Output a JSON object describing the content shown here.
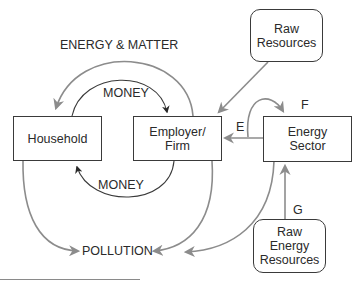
{
  "diagram": {
    "type": "flow-diagram",
    "colors": {
      "box_border": "#3a3a3a",
      "flow_arrow": "#8c8c8c",
      "money_arrow": "#2a2a2a",
      "text": "#2a2a2a"
    },
    "nodes": {
      "household": {
        "label": "Household"
      },
      "employer": {
        "line1": "Employer/",
        "line2": "Firm"
      },
      "energy_sector": {
        "line1": "Energy",
        "line2": "Sector"
      },
      "raw_resources": {
        "line1": "Raw",
        "line2": "Resources"
      },
      "raw_energy_resources": {
        "line1": "Raw",
        "line2": "Energy",
        "line3": "Resources"
      }
    },
    "labels": {
      "energy_matter": "ENERGY & MATTER",
      "money_top": "MONEY",
      "money_bottom": "MONEY",
      "pollution": "POLLUTION",
      "e": "E",
      "f": "F",
      "g": "G"
    },
    "edges": [
      {
        "from": "employer",
        "to": "household",
        "label": "ENERGY & MATTER"
      },
      {
        "from": "household",
        "to": "employer",
        "label": "MONEY"
      },
      {
        "from": "employer",
        "to": "household",
        "label": "MONEY"
      },
      {
        "from": "raw_resources",
        "to": "employer",
        "label": ""
      },
      {
        "from": "energy_sector",
        "to": "employer",
        "label": "E"
      },
      {
        "from": "energy_sector",
        "to": "energy_sector",
        "label": "F"
      },
      {
        "from": "raw_energy_resources",
        "to": "energy_sector",
        "label": "G"
      },
      {
        "from": "household",
        "to": "pollution",
        "label": ""
      },
      {
        "from": "employer",
        "to": "pollution",
        "label": ""
      },
      {
        "from": "energy_sector",
        "to": "pollution",
        "label": ""
      }
    ]
  }
}
